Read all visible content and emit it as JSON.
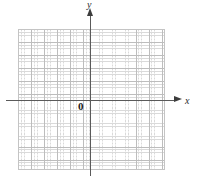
{
  "figure": {
    "title": "",
    "background_color": "#ffffff",
    "width": 198,
    "height": 185
  },
  "axes": {
    "x_label": "x",
    "y_label": "y",
    "origin_label": "0",
    "axis_color": "#5a5a5a",
    "arrow_color": "#3d3d3d",
    "x_has_arrow": true,
    "y_has_arrow": true
  },
  "grid": {
    "major_color": "#bdbdbd",
    "minor_color": "#d9d9d9",
    "border_color": "#c4c4c4",
    "major_cell_px": 13,
    "minor_cell_px": 3.25,
    "columns": 11,
    "rows": 11,
    "style": "dotted-minor-with-solid-major"
  },
  "chart_data": {
    "type": "scatter",
    "title": "",
    "subtitle": "",
    "xlabel": "x",
    "ylabel": "y",
    "series": [
      {
        "name": "",
        "x": [],
        "y": []
      }
    ],
    "annotations": [
      {
        "text": "0",
        "role": "origin-label"
      },
      {
        "text": "x",
        "role": "x-axis-label"
      },
      {
        "text": "y",
        "role": "y-axis-label"
      }
    ],
    "xlim": [
      -6,
      6
    ],
    "ylim": [
      -6,
      6
    ],
    "xticks": [],
    "yticks": [],
    "grid": true,
    "legend": false,
    "legend_position": "none",
    "note": "Blank Cartesian grid / graph paper with no plotted data points"
  }
}
